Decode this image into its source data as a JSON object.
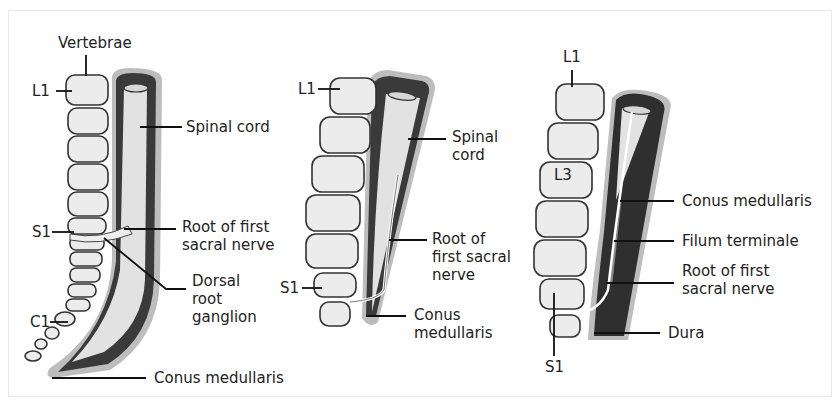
{
  "figure": {
    "panels": [
      {
        "id": "newborn",
        "labels": {
          "vertebrae": "Vertebrae",
          "l1": "L1",
          "s1": "S1",
          "c1": "C1",
          "spinal_cord": "Spinal cord",
          "root": [
            "Root of first",
            "sacral nerve"
          ],
          "drg": [
            "Dorsal",
            "root",
            "ganglion"
          ],
          "conus": "Conus medullaris"
        }
      },
      {
        "id": "child",
        "labels": {
          "l1": "L1",
          "s1": "S1",
          "spinal_cord": [
            "Spinal",
            "cord"
          ],
          "root": [
            "Root of",
            "first sacral",
            "nerve"
          ],
          "conus": [
            "Conus",
            "medullaris"
          ]
        }
      },
      {
        "id": "adult",
        "labels": {
          "l1": "L1",
          "l3": "L3",
          "s1": "S1",
          "conus": "Conus medullaris",
          "filum": "Filum terminale",
          "root": [
            "Root of first",
            "sacral nerve"
          ],
          "dura": "Dura"
        }
      }
    ],
    "colors": {
      "dura_outer": "#b9b9b9",
      "dura_dark": "#3a3a3a",
      "cord": "#e4e4e4",
      "vertebra": "#ececec"
    }
  }
}
